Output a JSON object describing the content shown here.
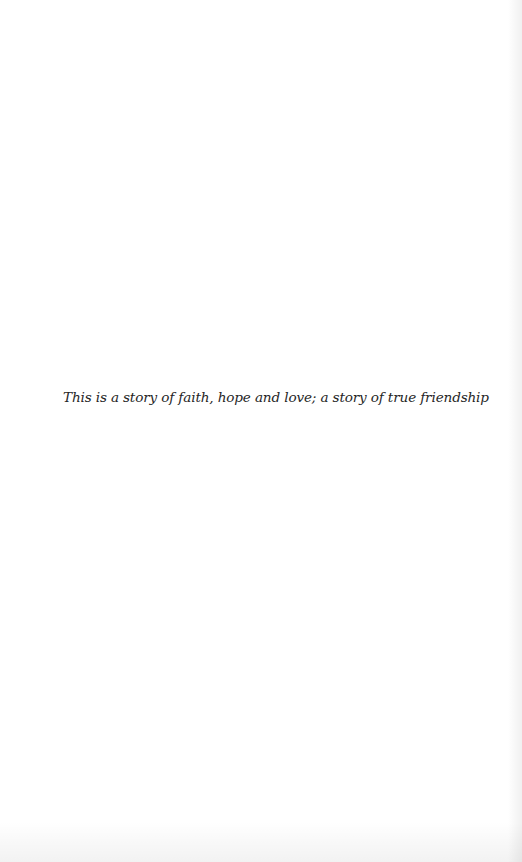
{
  "page": {
    "background_color": "#ffffff",
    "text_color": "#262626",
    "epigraph": "This is a story of faith, hope and love; a story of true friendship"
  }
}
